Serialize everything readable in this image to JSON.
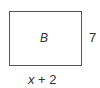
{
  "diagram": {
    "shape": "rectangle",
    "name_label": "B",
    "height_label": "7",
    "width_label": {
      "variable": "x",
      "rest": " + 2"
    },
    "stroke_color": "#555555",
    "text_color": "#333333"
  }
}
